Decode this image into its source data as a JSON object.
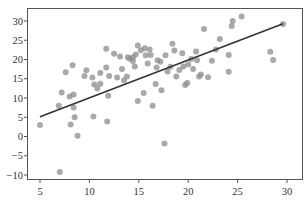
{
  "chart_data": {
    "type": "scatter",
    "title": "",
    "xlabel": "",
    "ylabel": "",
    "xlim": [
      3.7,
      31.4
    ],
    "ylim": [
      -11.2,
      33.5
    ],
    "grid": false,
    "legend": null,
    "x_ticks": [
      5,
      10,
      15,
      20,
      25,
      30
    ],
    "y_ticks": [
      -10,
      -5,
      0,
      5,
      10,
      15,
      20,
      25,
      30
    ],
    "x_tick_labels": [
      "5",
      "10",
      "15",
      "20",
      "25",
      "30"
    ],
    "y_tick_labels": [
      "−10",
      "−5",
      "0",
      "5",
      "10",
      "15",
      "20",
      "25",
      "30"
    ],
    "point_color": "#8c8c8c",
    "point_opacity": 0.75,
    "line_color": "#333333",
    "regression_line": {
      "x": [
        5,
        29.6
      ],
      "y": [
        5.1,
        29.3
      ]
    },
    "points": [
      {
        "x": 5.0,
        "y": 3.0
      },
      {
        "x": 6.9,
        "y": 8.0
      },
      {
        "x": 7.0,
        "y": -9.2
      },
      {
        "x": 8.1,
        "y": 3.1
      },
      {
        "x": 8.4,
        "y": 7.5
      },
      {
        "x": 8.5,
        "y": 5.0
      },
      {
        "x": 8.8,
        "y": 0.2
      },
      {
        "x": 10.4,
        "y": 5.2
      },
      {
        "x": 11.8,
        "y": 3.9
      },
      {
        "x": 7.2,
        "y": 11.4
      },
      {
        "x": 8.0,
        "y": 10.4
      },
      {
        "x": 8.4,
        "y": 10.9
      },
      {
        "x": 7.6,
        "y": 16.7
      },
      {
        "x": 8.3,
        "y": 18.5
      },
      {
        "x": 9.5,
        "y": 15.7
      },
      {
        "x": 9.7,
        "y": 17.2
      },
      {
        "x": 10.3,
        "y": 15.3
      },
      {
        "x": 10.5,
        "y": 13.5
      },
      {
        "x": 10.8,
        "y": 12.5
      },
      {
        "x": 11.1,
        "y": 16.5
      },
      {
        "x": 11.1,
        "y": 13.7
      },
      {
        "x": 11.7,
        "y": 17.9
      },
      {
        "x": 12.0,
        "y": 15.7
      },
      {
        "x": 11.9,
        "y": 10.6
      },
      {
        "x": 11.7,
        "y": 22.8
      },
      {
        "x": 12.5,
        "y": 21.5
      },
      {
        "x": 12.8,
        "y": 15.3
      },
      {
        "x": 13.1,
        "y": 20.8
      },
      {
        "x": 13.3,
        "y": 17.5
      },
      {
        "x": 13.5,
        "y": 14.6
      },
      {
        "x": 13.8,
        "y": 15.6
      },
      {
        "x": 13.9,
        "y": 20.6
      },
      {
        "x": 14.1,
        "y": 20.2
      },
      {
        "x": 14.4,
        "y": 19.6
      },
      {
        "x": 14.6,
        "y": 18.2
      },
      {
        "x": 14.7,
        "y": 21.3
      },
      {
        "x": 14.4,
        "y": 20.6
      },
      {
        "x": 14.9,
        "y": 9.2
      },
      {
        "x": 14.9,
        "y": 23.6
      },
      {
        "x": 15.2,
        "y": 22.4
      },
      {
        "x": 15.6,
        "y": 22.9
      },
      {
        "x": 15.7,
        "y": 21.1
      },
      {
        "x": 16.1,
        "y": 22.6
      },
      {
        "x": 16.2,
        "y": 21.2
      },
      {
        "x": 16.4,
        "y": 8.0
      },
      {
        "x": 15.5,
        "y": 11.3
      },
      {
        "x": 16.8,
        "y": 17.9
      },
      {
        "x": 16.7,
        "y": 13.6
      },
      {
        "x": 17.2,
        "y": 19.4
      },
      {
        "x": 17.3,
        "y": 12.0
      },
      {
        "x": 17.6,
        "y": -1.8
      },
      {
        "x": 17.7,
        "y": 21.1
      },
      {
        "x": 17.9,
        "y": 16.9
      },
      {
        "x": 18.2,
        "y": 18.1
      },
      {
        "x": 18.4,
        "y": 24.1
      },
      {
        "x": 18.8,
        "y": 15.6
      },
      {
        "x": 19.1,
        "y": 17.3
      },
      {
        "x": 19.4,
        "y": 21.6
      },
      {
        "x": 19.5,
        "y": 18.2
      },
      {
        "x": 19.7,
        "y": 13.4
      },
      {
        "x": 20.0,
        "y": 18.7
      },
      {
        "x": 20.3,
        "y": 20.1
      },
      {
        "x": 20.5,
        "y": 17.5
      },
      {
        "x": 20.8,
        "y": 22.1
      },
      {
        "x": 20.9,
        "y": 19.8
      },
      {
        "x": 21.1,
        "y": 15.6
      },
      {
        "x": 21.3,
        "y": 16.1
      },
      {
        "x": 21.6,
        "y": 27.9
      },
      {
        "x": 22.4,
        "y": 19.7
      },
      {
        "x": 22.8,
        "y": 22.6
      },
      {
        "x": 23.2,
        "y": 25.3
      },
      {
        "x": 24.1,
        "y": 16.8
      },
      {
        "x": 24.1,
        "y": 21.2
      },
      {
        "x": 24.4,
        "y": 28.7
      },
      {
        "x": 24.5,
        "y": 30.0
      },
      {
        "x": 25.4,
        "y": 31.2
      },
      {
        "x": 22.0,
        "y": 15.4
      },
      {
        "x": 19.9,
        "y": 13.9
      },
      {
        "x": 28.3,
        "y": 22.0
      },
      {
        "x": 28.6,
        "y": 19.9
      },
      {
        "x": 29.6,
        "y": 29.2
      },
      {
        "x": 18.6,
        "y": 22.3
      },
      {
        "x": 16.9,
        "y": 19.8
      },
      {
        "x": 15.9,
        "y": 19.0
      }
    ]
  }
}
